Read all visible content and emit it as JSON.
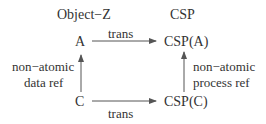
{
  "headers": {
    "left": "Object−Z",
    "right": "CSP"
  },
  "nodes": {
    "a": "A",
    "csp_a": "CSP(A)",
    "c": "C",
    "csp_c": "CSP(C)"
  },
  "edges": {
    "top_label": "trans",
    "bottom_label": "trans",
    "left_label_line1": "non−atomic",
    "left_label_line2": "data ref",
    "right_label_line1": "non−atomic",
    "right_label_line2": "process ref"
  },
  "colors": {
    "text": "#333333",
    "arrow": "#555555"
  }
}
